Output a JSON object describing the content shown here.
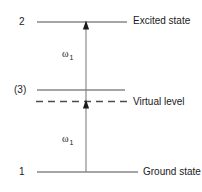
{
  "diagram": {
    "stroke_color": "#4d4d4d",
    "text_color": "#1a1a1a",
    "background": "#ffffff",
    "levels": [
      {
        "id": "excited",
        "number": "2",
        "name": "Excited state",
        "style": "solid",
        "y": 22
      },
      {
        "id": "intermediate",
        "number": "(3)",
        "name": "",
        "style": "solid",
        "y": 90
      },
      {
        "id": "virtual",
        "number": "",
        "name": "Virtual level",
        "style": "dashed",
        "y": 101
      },
      {
        "id": "ground",
        "number": "1",
        "name": "Ground state",
        "style": "solid",
        "y": 172
      }
    ],
    "transitions": [
      {
        "id": "lower",
        "label": "ω",
        "subscript": "1",
        "from": "ground",
        "to": "virtual",
        "direction": "up"
      },
      {
        "id": "upper",
        "label": "ω",
        "subscript": "1",
        "from": "virtual",
        "to": "excited",
        "direction": "up"
      }
    ]
  }
}
